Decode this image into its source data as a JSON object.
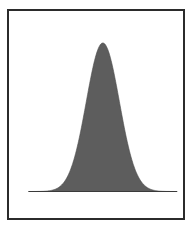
{
  "figure": {
    "title": "",
    "frame": {
      "border_color": "#2b2b2b",
      "border_width_px": 2,
      "background_color": "#ffffff"
    }
  },
  "chart_data": {
    "type": "area",
    "title": "",
    "subtitle": "",
    "xlabel": "",
    "ylabel": "",
    "legend": [],
    "legend_position": "none",
    "grid": false,
    "axis_ticks": [],
    "tick_labels": [],
    "annotations": [],
    "fill_color": "#5d5d5d",
    "line_color": "#4a4a4a",
    "baseline_color": "#3a3a3a",
    "xlim": [
      -4.5,
      4.5
    ],
    "ylim": [
      0,
      1.05
    ],
    "distribution": {
      "name": "normal",
      "mean": 0,
      "sigma": 1,
      "peak_height": 1.0
    },
    "x": [
      -4.5,
      -4.2,
      -3.9,
      -3.6,
      -3.3,
      -3.0,
      -2.7,
      -2.4,
      -2.1,
      -1.8,
      -1.5,
      -1.2,
      -0.9,
      -0.6,
      -0.3,
      0.0,
      0.3,
      0.6,
      0.9,
      1.2,
      1.5,
      1.8,
      2.1,
      2.4,
      2.7,
      3.0,
      3.3,
      3.6,
      3.9,
      4.2,
      4.5
    ],
    "values": [
      0.0,
      0.0002,
      0.0004,
      0.0015,
      0.0045,
      0.0111,
      0.0265,
      0.0561,
      0.1103,
      0.1979,
      0.3247,
      0.4868,
      0.667,
      0.8353,
      0.956,
      1.0,
      0.956,
      0.8353,
      0.667,
      0.4868,
      0.3247,
      0.1979,
      0.1103,
      0.0561,
      0.0265,
      0.0111,
      0.0045,
      0.0015,
      0.0004,
      0.0002,
      0.0
    ]
  }
}
